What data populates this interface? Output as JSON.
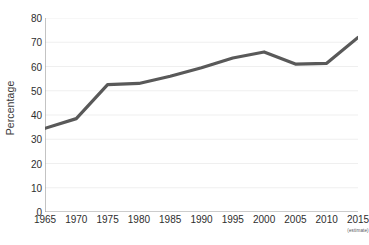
{
  "chart_data": {
    "type": "line",
    "title": "",
    "xlabel": "",
    "ylabel": "Percentage",
    "x": [
      1965,
      1970,
      1975,
      1980,
      1985,
      1990,
      1995,
      2000,
      2005,
      2010,
      2015
    ],
    "categories": [
      "1965",
      "1970",
      "1975",
      "1980",
      "1985",
      "1990",
      "1995",
      "2000",
      "2005",
      "2010",
      "2015"
    ],
    "values": [
      34.5,
      38.5,
      52.5,
      53,
      56,
      59.5,
      63.5,
      66,
      61,
      61.3,
      72
    ],
    "series": [
      {
        "name": "Percentage",
        "values": [
          34.5,
          38.5,
          52.5,
          53,
          56,
          59.5,
          63.5,
          66,
          61,
          61.3,
          72
        ]
      }
    ],
    "ylim": [
      0,
      80
    ],
    "xlim": [
      1965,
      2015
    ],
    "yticks": [
      0,
      10,
      20,
      30,
      40,
      50,
      60,
      70,
      80
    ],
    "ytick_labels": [
      "0",
      "10",
      "20",
      "30",
      "40",
      "50",
      "60",
      "70",
      "80"
    ],
    "xticks": [
      1965,
      1970,
      1975,
      1980,
      1985,
      1990,
      1995,
      2000,
      2005,
      2010,
      2015
    ],
    "xtick_labels": [
      "1965",
      "1970",
      "1975",
      "1980",
      "1985",
      "1990",
      "1995",
      "2000",
      "2005",
      "2010",
      "2015"
    ],
    "annotations": [
      {
        "text": "(estimate)",
        "attached_to": "2015"
      }
    ],
    "grid": "horizontal",
    "legend": "none",
    "colors": {
      "line": "#595959",
      "grid": "#efefef",
      "axis": "#9a9a9a",
      "text": "#2e2e2e",
      "background": "#ffffff"
    },
    "line_width": 3.2
  },
  "axis": {
    "y_title": "Percentage"
  },
  "notes": {
    "estimate": "(estimate)"
  }
}
